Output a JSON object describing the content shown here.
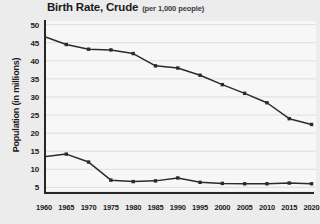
{
  "chart_data": {
    "type": "line",
    "title": "Birth Rate, Crude",
    "subtitle": "(per 1,000 people)",
    "xlabel": "",
    "ylabel": "Population (in millions)",
    "x": [
      1960,
      1965,
      1970,
      1975,
      1980,
      1985,
      1990,
      1995,
      2000,
      2005,
      2010,
      2015,
      2020
    ],
    "xtick_labels": [
      "1960",
      "1965",
      "1970",
      "1975",
      "1980",
      "1985",
      "1990",
      "1995",
      "2000",
      "2005",
      "2010",
      "2015",
      "2020"
    ],
    "ytick_labels": [
      "50",
      "45",
      "40",
      "35",
      "30",
      "25",
      "20",
      "15",
      "10",
      "5"
    ],
    "ytick_values": [
      50,
      45,
      40,
      35,
      30,
      25,
      20,
      15,
      10,
      5
    ],
    "xlim": [
      1960,
      2021
    ],
    "ylim": [
      4,
      51
    ],
    "grid": true,
    "grid_axis": "y",
    "legend": "none",
    "markers": true,
    "series": [
      {
        "name": "upper-series",
        "color": "#2b2b2b",
        "values": [
          46.7,
          44.5,
          43.2,
          43.0,
          42.0,
          38.6,
          38.0,
          36.0,
          33.4,
          31.0,
          28.4,
          24.0,
          22.4
        ]
      },
      {
        "name": "lower-series",
        "color": "#2b2b2b",
        "values": [
          13.5,
          14.2,
          12.0,
          7.0,
          6.6,
          6.8,
          7.6,
          6.4,
          6.1,
          6.0,
          6.0,
          6.2,
          6.0
        ]
      }
    ]
  },
  "colors": {
    "page_background": "#ececed",
    "plot_background": "#f7f7f7",
    "axis": "#262626",
    "grid": "#dedede",
    "line": "#2b2b2b",
    "text": "#1b1b1b"
  }
}
